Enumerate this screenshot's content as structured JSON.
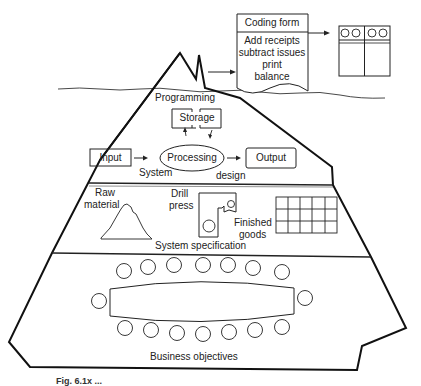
{
  "figure": {
    "caption": "Fig. 6.1x  ...",
    "colors": {
      "ink": "#222222",
      "background": "#ffffff"
    }
  },
  "coding_form": {
    "title": "Coding form",
    "lines": [
      "Add receipts",
      "subtract issues",
      "print",
      "balance"
    ]
  },
  "layers": {
    "programming": {
      "label": "Programming",
      "storage": "Storage",
      "input": "Input",
      "processing": "Processing",
      "output": "Output"
    },
    "system_design": {
      "label_left": "System",
      "label_right": "design"
    },
    "system_specification": {
      "label": "System specification",
      "raw_material": [
        "Raw",
        "material"
      ],
      "drill_press": [
        "Drill",
        "press"
      ],
      "finished_goods": [
        "Finished",
        "goods"
      ]
    },
    "business_objectives": {
      "label": "Business objectives",
      "seats_top": 7,
      "seats_bottom": 7,
      "seats_ends": 2
    }
  }
}
